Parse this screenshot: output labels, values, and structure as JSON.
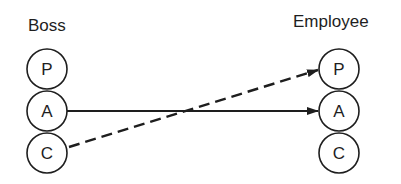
{
  "diagram": {
    "type": "transaction-diagram",
    "left_column": {
      "title": "Boss",
      "states": [
        "P",
        "A",
        "C"
      ]
    },
    "right_column": {
      "title": "Employee",
      "states": [
        "P",
        "A",
        "C"
      ]
    },
    "transactions": [
      {
        "from": "Boss.A",
        "to": "Employee.A",
        "style": "solid"
      },
      {
        "from": "Boss.C",
        "to": "Employee.P",
        "style": "dashed"
      }
    ]
  }
}
